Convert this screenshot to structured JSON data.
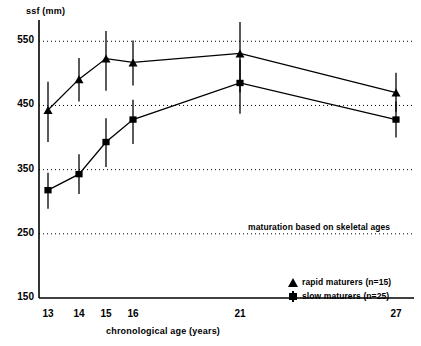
{
  "chart_data": {
    "type": "line",
    "title": "",
    "ylabel": "ssf (mm)",
    "xlabel": "chronological age (years)",
    "x": [
      13,
      14,
      15,
      16,
      21,
      27
    ],
    "xticklabels": [
      "13",
      "14",
      "15",
      "16",
      "21",
      "27"
    ],
    "yticklabels": [
      "150",
      "250",
      "350",
      "450",
      "550"
    ],
    "yticks": [
      150,
      250,
      350,
      450,
      550
    ],
    "ylim": [
      150,
      580
    ],
    "grid": "horizontal-dotted",
    "legend_position": "bottom-right",
    "annotation": "maturation based on skeletal ages",
    "series": [
      {
        "name": "rapid maturers (n=15)",
        "marker": "triangle",
        "n": 15,
        "values": [
          443,
          491,
          523,
          517,
          531,
          470
        ],
        "err_low": [
          393,
          456,
          473,
          481,
          470,
          440
        ],
        "err_high": [
          487,
          524,
          566,
          551,
          580,
          501
        ]
      },
      {
        "name": "slow maturers (n=25)",
        "marker": "square",
        "n": 25,
        "values": [
          318,
          343,
          393,
          428,
          485,
          428
        ],
        "err_low": [
          289,
          312,
          354,
          390,
          437,
          400
        ],
        "err_high": [
          345,
          374,
          430,
          459,
          521,
          456
        ]
      }
    ]
  },
  "axes": {
    "ylabel": "ssf (mm)",
    "xlabel": "chronological age (years)"
  },
  "legend": {
    "rapid": "rapid maturers (n=15)",
    "slow": "slow maturers (n=25)"
  },
  "annotation": {
    "text": "maturation based on skeletal ages"
  }
}
